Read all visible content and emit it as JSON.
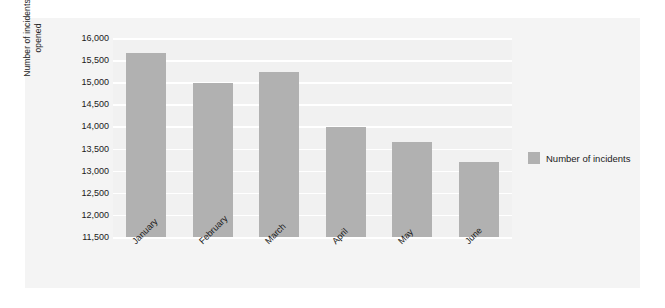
{
  "chart_data": {
    "type": "bar",
    "title": "",
    "subtitle": "",
    "xlabel": "",
    "ylabel": "Number of incidents\nopened",
    "categories": [
      "January",
      "February",
      "March",
      "April",
      "May",
      "June"
    ],
    "series": [
      {
        "name": "Number of incidents",
        "values": [
          15650,
          14980,
          15230,
          13980,
          13640,
          13200
        ],
        "color": "#b1b1b1"
      }
    ],
    "ylim": [
      11500,
      16000
    ],
    "ytick_step": 500,
    "ytick_labels": [
      "16,000",
      "15,500",
      "15,000",
      "14,500",
      "14,000",
      "13,500",
      "13,000",
      "12,500",
      "12,000",
      "11,500"
    ],
    "ytick_values": [
      16000,
      15500,
      15000,
      14500,
      14000,
      13500,
      13000,
      12500,
      12000,
      11500
    ],
    "grid": true,
    "grid_color": "#ffffff",
    "legend_position": "right",
    "plot_background": "#f1f1f1",
    "panel_background": "#f4f4f4",
    "xtick_rotation": -45
  },
  "legend": {
    "entries": [
      {
        "label": "Number of incidents",
        "color": "#b1b1b1"
      }
    ]
  }
}
